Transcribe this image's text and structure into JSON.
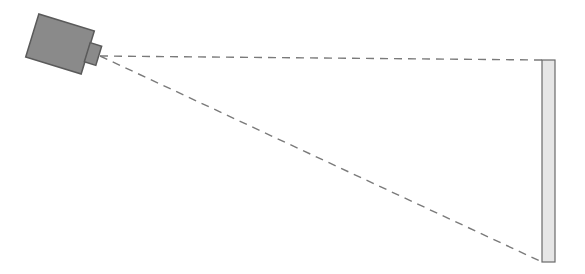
{
  "diagram": {
    "type": "camera-field-of-view",
    "colors": {
      "background": "#ffffff",
      "camera_body": "#8a8a8a",
      "camera_lens": "#8a8a8a",
      "outline": "#5a5a5a",
      "ray_line": "#7a7a7a",
      "panel_fill": "#e6e6e6",
      "panel_stroke": "#6a6a6a"
    },
    "camera": {
      "body": {
        "cx": 60,
        "cy": 44,
        "width": 58,
        "height": 45,
        "rotation_deg": 17
      },
      "lens": {
        "cx": 93,
        "cy": 54,
        "width": 12,
        "height": 20,
        "rotation_deg": 17
      },
      "apex": {
        "x": 100,
        "y": 56
      }
    },
    "panel": {
      "x": 542,
      "y": 60,
      "width": 13,
      "height": 202
    },
    "rays": [
      {
        "x1": 100,
        "y1": 56,
        "x2": 542,
        "y2": 60
      },
      {
        "x1": 100,
        "y1": 56,
        "x2": 542,
        "y2": 262
      }
    ]
  }
}
